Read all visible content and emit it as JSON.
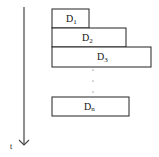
{
  "diagram": {
    "time_axis": {
      "label": "t",
      "direction": "down"
    },
    "blocks": [
      {
        "label": "D",
        "sub": "1"
      },
      {
        "label": "D",
        "sub": "2"
      },
      {
        "label": "D",
        "sub": "3"
      },
      {
        "label": "D",
        "sub": "n"
      }
    ],
    "ellipsis": "⋮",
    "colors": {
      "stroke": "#222222",
      "fill": "#ffffff",
      "text": "#111111"
    }
  }
}
